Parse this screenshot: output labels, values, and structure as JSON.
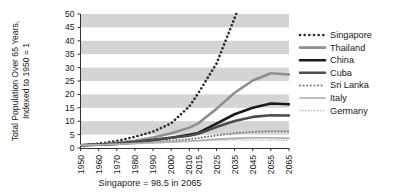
{
  "chart_data": {
    "type": "line",
    "title": "",
    "subtitle": "",
    "xlabel": "",
    "ylabel": "Total Population Over 65 Years,\nIndexed to 1950 = 1",
    "ylabel_line1": "Total Population Over 65 Years,",
    "ylabel_line2": "Indexed to 1950 = 1",
    "grid": "horizontal alternating gray bands (5-unit stripes)",
    "legend_position": "right",
    "ylim": [
      0,
      50
    ],
    "ytick_labels": [
      "0",
      "5",
      "10",
      "15",
      "20",
      "25",
      "30",
      "35",
      "40",
      "45",
      "50"
    ],
    "ytick_values": [
      0,
      5,
      10,
      15,
      20,
      25,
      30,
      35,
      40,
      45,
      50
    ],
    "x": [
      1950,
      1960,
      1970,
      1980,
      1990,
      2000,
      2010,
      2015,
      2025,
      2035,
      2045,
      2055,
      2065
    ],
    "xtick_labels": [
      "1950",
      "1960",
      "1970",
      "1980",
      "1990",
      "2000",
      "2010",
      "2015",
      "2025",
      "2035",
      "2045",
      "2055",
      "2065"
    ],
    "annotation": "Singapore = 98.5 in 2065",
    "series": [
      {
        "name": "Singapore",
        "style": "dotted",
        "width": 2.6,
        "color": "#2b2b2b",
        "values": [
          1,
          1.6,
          2.6,
          4.2,
          6.1,
          9.2,
          15.5,
          20.5,
          31.5,
          48.5,
          66.0,
          84.0,
          98.5
        ],
        "clipped_above_axis_max": true
      },
      {
        "name": "Thailand",
        "style": "solid",
        "width": 2.6,
        "color": "#8e8e8e",
        "values": [
          1,
          1.3,
          1.9,
          2.7,
          3.9,
          5.5,
          7.6,
          9.2,
          14.6,
          20.6,
          25.2,
          27.9,
          27.4
        ]
      },
      {
        "name": "China",
        "style": "solid",
        "width": 2.6,
        "color": "#1a1a1a",
        "values": [
          1,
          1.2,
          1.5,
          2.1,
          2.9,
          3.8,
          4.9,
          5.6,
          9.1,
          12.6,
          15.0,
          16.6,
          16.3
        ]
      },
      {
        "name": "Cuba",
        "style": "solid",
        "width": 2.6,
        "color": "#4d4d4d",
        "values": [
          1,
          1.3,
          1.7,
          2.3,
          3.1,
          3.8,
          4.6,
          5.3,
          7.8,
          10.1,
          11.6,
          12.2,
          12.1
        ]
      },
      {
        "name": "Sri Lanka",
        "style": "dotted",
        "width": 2.0,
        "color": "#7a7a7a",
        "values": [
          1,
          1.2,
          1.5,
          1.8,
          2.2,
          2.7,
          3.3,
          3.7,
          4.7,
          5.5,
          6.0,
          6.3,
          6.2
        ]
      },
      {
        "name": "Italy",
        "style": "solid",
        "width": 1.6,
        "color": "#aaaaaa",
        "values": [
          1,
          1.2,
          1.4,
          1.7,
          2.0,
          2.3,
          2.6,
          2.8,
          3.3,
          3.6,
          3.8,
          3.8,
          3.6
        ]
      },
      {
        "name": "Germany",
        "style": "dotted",
        "width": 1.6,
        "color": "#b8b8b8",
        "values": [
          1,
          1.2,
          1.4,
          1.6,
          1.8,
          2.1,
          2.4,
          2.5,
          2.9,
          3.0,
          3.0,
          3.0,
          2.9
        ]
      }
    ]
  },
  "legend": {
    "items": [
      {
        "label": "Singapore"
      },
      {
        "label": "Thailand"
      },
      {
        "label": "China"
      },
      {
        "label": "Cuba"
      },
      {
        "label": "Sri Lanka"
      },
      {
        "label": "Italy"
      },
      {
        "label": "Germany"
      }
    ]
  },
  "colors": {
    "band": "#d4d4d4",
    "background": "#ffffff",
    "axis": "#333333",
    "text": "#1a1a1a"
  }
}
